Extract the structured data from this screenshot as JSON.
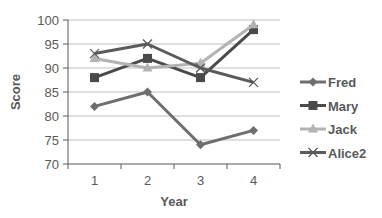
{
  "chart_data": {
    "type": "line",
    "title": "",
    "xlabel": "Year",
    "ylabel": "Score",
    "categories": [
      "1",
      "2",
      "3",
      "4"
    ],
    "ylim": [
      70,
      100
    ],
    "yticks": [
      70,
      75,
      80,
      85,
      90,
      95,
      100
    ],
    "grid": true,
    "legend_position": "right",
    "series": [
      {
        "name": "Fred",
        "values": [
          82,
          85,
          74,
          77
        ],
        "color": "#6e6e6e",
        "marker": "diamond"
      },
      {
        "name": "Mary",
        "values": [
          88,
          92,
          88,
          98
        ],
        "color": "#4a4a4a",
        "marker": "square"
      },
      {
        "name": "Jack",
        "values": [
          92,
          90,
          91,
          99
        ],
        "color": "#b3b3b3",
        "marker": "triangle"
      },
      {
        "name": "Alice2",
        "values": [
          93,
          95,
          90,
          87
        ],
        "color": "#5a5a5a",
        "marker": "x"
      }
    ]
  }
}
